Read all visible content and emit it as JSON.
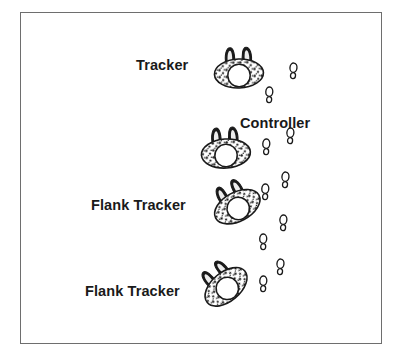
{
  "figure": {
    "title_text": "",
    "background_color": "#ffffff",
    "border_color": "#6e6e6e",
    "ink_color": "#1a1a1a",
    "frame": {
      "x": 20,
      "y": 12,
      "width": 362,
      "height": 332
    }
  },
  "labels": [
    {
      "id": "label-tracker",
      "text": "Tracker",
      "x": 136,
      "y": 58
    },
    {
      "id": "label-controller",
      "text": "Controller",
      "x": 240,
      "y": 116
    },
    {
      "id": "label-flank-tracker-1",
      "text": "Flank Tracker",
      "x": 91,
      "y": 198
    },
    {
      "id": "label-flank-tracker-2",
      "text": "Flank Tracker",
      "x": 85,
      "y": 284
    }
  ],
  "dogs": [
    {
      "id": "dog-tracker",
      "role": "Tracker",
      "cx": 239,
      "cy": 75,
      "rotation": -2,
      "scale": 1.0
    },
    {
      "id": "dog-controller",
      "role": "Controller",
      "cx": 226,
      "cy": 155,
      "rotation": -4,
      "scale": 1.0
    },
    {
      "id": "dog-flank-tracker-1",
      "role": "Flank Tracker",
      "cx": 238,
      "cy": 208,
      "rotation": -28,
      "scale": 1.0
    },
    {
      "id": "dog-flank-tracker-2",
      "role": "Flank Tracker",
      "cx": 227,
      "cy": 288,
      "rotation": -40,
      "scale": 1.0
    }
  ],
  "paw_prints": [
    {
      "id": "paw-1",
      "x": 293,
      "y": 72,
      "rotation": 6
    },
    {
      "id": "paw-2",
      "x": 269,
      "y": 96,
      "rotation": 4
    },
    {
      "id": "paw-3",
      "x": 290,
      "y": 137,
      "rotation": 5
    },
    {
      "id": "paw-4",
      "x": 266,
      "y": 148,
      "rotation": 4
    },
    {
      "id": "paw-5",
      "x": 285,
      "y": 181,
      "rotation": 6
    },
    {
      "id": "paw-6",
      "x": 265,
      "y": 193,
      "rotation": 4
    },
    {
      "id": "paw-7",
      "x": 283,
      "y": 224,
      "rotation": 5
    },
    {
      "id": "paw-8",
      "x": 263,
      "y": 243,
      "rotation": 3
    },
    {
      "id": "paw-9",
      "x": 280,
      "y": 268,
      "rotation": 6
    },
    {
      "id": "paw-10",
      "x": 263,
      "y": 285,
      "rotation": 4
    }
  ],
  "legend_note": ""
}
